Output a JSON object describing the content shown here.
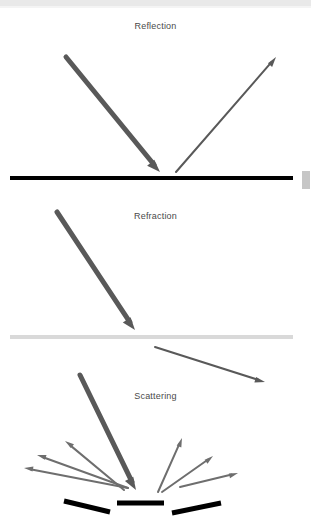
{
  "document": {
    "title": "Optical phenomena diagram",
    "background_color": "#ffffff"
  },
  "artifacts": {
    "top_bar_color": "#e9e9e9",
    "scrollbar_thumb_color": "#c6c6c6",
    "scrollbar_thumb_label": "vertical-scrollbar-thumb"
  },
  "palette": {
    "incident_arrow": "#595959",
    "outgoing_arrow": "#595959",
    "scatter_arrow": "#6e6e6e",
    "smooth_surface": "#000000",
    "interface_line": "#d9d9d9",
    "rough_surface": "#000000",
    "caption_text": "#4a4a4a"
  },
  "panels": [
    {
      "id": "reflection",
      "caption": "Reflection",
      "caption_y": 21,
      "surface": {
        "name": "smooth-mirror-surface",
        "type": "solid-black-line",
        "x1": 10,
        "y1": 178,
        "x2": 293,
        "y2": 178,
        "width": 4,
        "color": "#000000"
      },
      "arrows": [
        {
          "name": "incident-ray-arrow",
          "style": "thick",
          "x1": 66,
          "y1": 57,
          "x2": 160,
          "y2": 172,
          "width": 5,
          "head": 13,
          "color": "#595959"
        },
        {
          "name": "reflected-ray-arrow",
          "style": "thin",
          "x1": 176,
          "y1": 172,
          "x2": 276,
          "y2": 57,
          "width": 2,
          "head": 10,
          "color": "#595959"
        }
      ]
    },
    {
      "id": "refraction",
      "caption": "Refraction",
      "caption_y": 211,
      "surface": {
        "name": "medium-interface-line",
        "type": "light-gray-line",
        "x1": 10,
        "y1": 337,
        "x2": 293,
        "y2": 337,
        "width": 4,
        "color": "#d9d9d9"
      },
      "arrows": [
        {
          "name": "incident-ray-arrow",
          "style": "thick",
          "x1": 57,
          "y1": 212,
          "x2": 135,
          "y2": 330,
          "width": 5,
          "head": 13,
          "color": "#595959"
        },
        {
          "name": "refracted-ray-arrow",
          "style": "thin",
          "x1": 155,
          "y1": 347,
          "x2": 265,
          "y2": 382,
          "width": 2,
          "head": 10,
          "color": "#595959"
        }
      ]
    },
    {
      "id": "scattering",
      "caption": "Scattering",
      "caption_y": 391,
      "surface_segments": [
        {
          "name": "rough-surface-segment-left",
          "x1": 64,
          "y1": 501,
          "x2": 110,
          "y2": 512,
          "width": 5,
          "color": "#000000"
        },
        {
          "name": "rough-surface-segment-center",
          "x1": 117,
          "y1": 503,
          "x2": 164,
          "y2": 503,
          "width": 5,
          "color": "#000000"
        },
        {
          "name": "rough-surface-segment-right",
          "x1": 172,
          "y1": 513,
          "x2": 221,
          "y2": 503,
          "width": 5,
          "color": "#000000"
        }
      ],
      "arrows": [
        {
          "name": "incident-ray-arrow",
          "style": "thick",
          "x1": 80,
          "y1": 375,
          "x2": 136,
          "y2": 490,
          "width": 5,
          "head": 13,
          "color": "#595959"
        },
        {
          "name": "scattered-ray-arrow-1",
          "style": "thin",
          "x1": 128,
          "y1": 488,
          "x2": 24,
          "y2": 468,
          "width": 2,
          "head": 9,
          "color": "#6e6e6e"
        },
        {
          "name": "scattered-ray-arrow-2",
          "style": "thin",
          "x1": 128,
          "y1": 488,
          "x2": 37,
          "y2": 455,
          "width": 2,
          "head": 9,
          "color": "#6e6e6e"
        },
        {
          "name": "scattered-ray-arrow-3",
          "style": "thin",
          "x1": 124,
          "y1": 490,
          "x2": 65,
          "y2": 441,
          "width": 2,
          "head": 9,
          "color": "#6e6e6e"
        },
        {
          "name": "scattered-ray-arrow-4",
          "style": "thin",
          "x1": 158,
          "y1": 492,
          "x2": 182,
          "y2": 438,
          "width": 2,
          "head": 9,
          "color": "#6e6e6e"
        },
        {
          "name": "scattered-ray-arrow-5",
          "style": "thin",
          "x1": 162,
          "y1": 492,
          "x2": 213,
          "y2": 456,
          "width": 2,
          "head": 9,
          "color": "#6e6e6e"
        },
        {
          "name": "scattered-ray-arrow-6",
          "style": "thin",
          "x1": 180,
          "y1": 487,
          "x2": 238,
          "y2": 473,
          "width": 2,
          "head": 9,
          "color": "#6e6e6e"
        }
      ]
    }
  ]
}
